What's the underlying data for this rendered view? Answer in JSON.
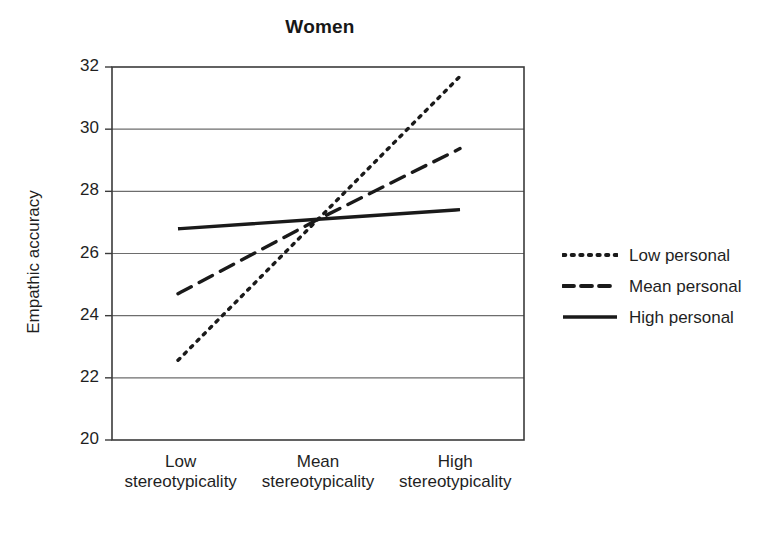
{
  "chart_data": {
    "type": "line",
    "title": "Women",
    "xlabel": "",
    "ylabel": "Empathic accuracy",
    "categories": [
      "Low\nstereotypicality",
      "Mean\nstereotypicality",
      "High\nstereotypicality"
    ],
    "category_lines": [
      [
        "Low",
        "stereotypicality"
      ],
      [
        "Mean",
        "stereotypicality"
      ],
      [
        "High",
        "stereotypicality"
      ]
    ],
    "ylim": [
      20,
      32
    ],
    "yticks": [
      32,
      30,
      28,
      26,
      24,
      22,
      20
    ],
    "grid": true,
    "legend_position": "right",
    "series": [
      {
        "name": "Low personal",
        "style": "dotted",
        "color": "#1a1a1a",
        "values": [
          22.65,
          27.1,
          31.55
        ]
      },
      {
        "name": "Mean personal",
        "style": "dashed",
        "color": "#1a1a1a",
        "values": [
          24.75,
          27.1,
          29.3
        ]
      },
      {
        "name": "High personal",
        "style": "solid",
        "color": "#1a1a1a",
        "values": [
          26.8,
          27.1,
          27.4
        ]
      }
    ]
  },
  "legend": {
    "items": [
      {
        "label": "Low personal",
        "style": "dotted"
      },
      {
        "label": "Mean personal",
        "style": "dashed"
      },
      {
        "label": "High personal",
        "style": "solid"
      }
    ]
  }
}
